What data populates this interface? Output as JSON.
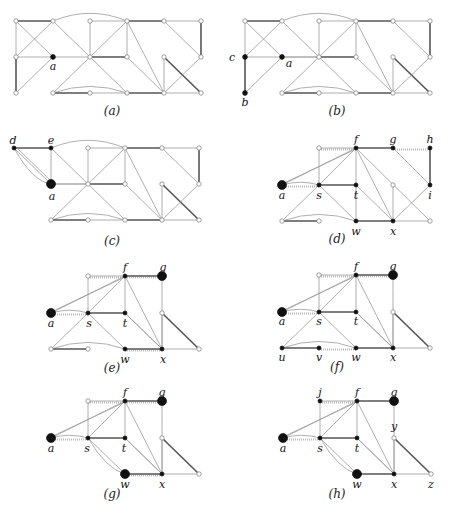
{
  "figure": {
    "panels": [
      {
        "id": "a",
        "caption": "(a)",
        "left": 0,
        "top": 0,
        "cap_top": 104,
        "labels": [
          {
            "text": "a",
            "x": 53,
            "y": 69
          }
        ],
        "variant": "full"
      },
      {
        "id": "b",
        "caption": "(b)",
        "left": 225,
        "top": 0,
        "cap_top": 104,
        "labels": [
          {
            "text": "c",
            "x": 7,
            "y": 60
          },
          {
            "text": "a",
            "x": 64,
            "y": 66
          },
          {
            "text": "b",
            "x": 20,
            "y": 105
          }
        ],
        "variant": "full_b"
      },
      {
        "id": "c",
        "caption": "(c)",
        "left": 0,
        "top": 128,
        "cap_top": 106,
        "labels": [
          {
            "text": "d",
            "x": 13,
            "y": 15
          },
          {
            "text": "e",
            "x": 51,
            "y": 15
          },
          {
            "text": "a",
            "x": 52,
            "y": 71
          }
        ],
        "variant": "full_c"
      },
      {
        "id": "d",
        "caption": "(d)",
        "left": 225,
        "top": 128,
        "cap_top": 104,
        "labels": [
          {
            "text": "f",
            "x": 131,
            "y": 14
          },
          {
            "text": "g",
            "x": 168,
            "y": 14
          },
          {
            "text": "h",
            "x": 205,
            "y": 14
          },
          {
            "text": "a",
            "x": 57,
            "y": 70
          },
          {
            "text": "s",
            "x": 94,
            "y": 70
          },
          {
            "text": "t",
            "x": 131,
            "y": 70
          },
          {
            "text": "i",
            "x": 205,
            "y": 70
          },
          {
            "text": "w",
            "x": 131,
            "y": 106
          },
          {
            "text": "x",
            "x": 168,
            "y": 106
          }
        ],
        "variant": "d"
      },
      {
        "id": "e",
        "caption": "(e)",
        "left": 0,
        "top": 256,
        "cap_top": 105,
        "labels": [
          {
            "text": "f",
            "x": 125,
            "y": 14
          },
          {
            "text": "g",
            "x": 163,
            "y": 14
          },
          {
            "text": "a",
            "x": 51,
            "y": 70
          },
          {
            "text": "s",
            "x": 89,
            "y": 70
          },
          {
            "text": "t",
            "x": 125,
            "y": 70
          },
          {
            "text": "w",
            "x": 125,
            "y": 106
          },
          {
            "text": "x",
            "x": 163,
            "y": 106
          }
        ],
        "variant": "e"
      },
      {
        "id": "f",
        "caption": "(f)",
        "left": 225,
        "top": 256,
        "cap_top": 104,
        "labels": [
          {
            "text": "f",
            "x": 131,
            "y": 13
          },
          {
            "text": "g",
            "x": 168,
            "y": 13
          },
          {
            "text": "a",
            "x": 57,
            "y": 68
          },
          {
            "text": "s",
            "x": 94,
            "y": 68
          },
          {
            "text": "t",
            "x": 131,
            "y": 68
          },
          {
            "text": "u",
            "x": 57,
            "y": 104
          },
          {
            "text": "v",
            "x": 94,
            "y": 104
          },
          {
            "text": "w",
            "x": 131,
            "y": 104
          },
          {
            "text": "x",
            "x": 168,
            "y": 104
          }
        ],
        "variant": "f"
      },
      {
        "id": "g",
        "caption": "(g)",
        "left": 0,
        "top": 384,
        "cap_top": 103,
        "labels": [
          {
            "text": "f",
            "x": 125,
            "y": 11
          },
          {
            "text": "g",
            "x": 162,
            "y": 11
          },
          {
            "text": "a",
            "x": 51,
            "y": 67
          },
          {
            "text": "s",
            "x": 87,
            "y": 67
          },
          {
            "text": "t",
            "x": 124,
            "y": 67
          },
          {
            "text": "w",
            "x": 125,
            "y": 103
          },
          {
            "text": "x",
            "x": 162,
            "y": 103
          }
        ],
        "variant": "g"
      },
      {
        "id": "h",
        "caption": "(h)",
        "left": 225,
        "top": 384,
        "cap_top": 103,
        "labels": [
          {
            "text": "j",
            "x": 95,
            "y": 11
          },
          {
            "text": "f",
            "x": 132,
            "y": 11
          },
          {
            "text": "g",
            "x": 169,
            "y": 11
          },
          {
            "text": "y",
            "x": 169,
            "y": 45
          },
          {
            "text": "a",
            "x": 58,
            "y": 67
          },
          {
            "text": "s",
            "x": 95,
            "y": 67
          },
          {
            "text": "t",
            "x": 132,
            "y": 67
          },
          {
            "text": "w",
            "x": 132,
            "y": 103
          },
          {
            "text": "x",
            "x": 169,
            "y": 103
          },
          {
            "text": "z",
            "x": 206,
            "y": 103
          }
        ],
        "variant": "h"
      }
    ]
  },
  "colors": {
    "edge": "#9a9a9a",
    "edge_thick": "#555555",
    "node_fill": "#ffffff",
    "node_stroke": "#777777",
    "node_black": "#111111",
    "dotted": "#bbbbbb"
  }
}
